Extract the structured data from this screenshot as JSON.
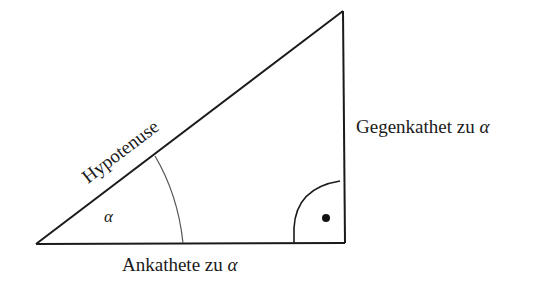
{
  "diagram": {
    "vertices": {
      "angle_vertex": {
        "x": 36,
        "y": 244
      },
      "right_angle_vertex": {
        "x": 345,
        "y": 243
      },
      "top_vertex": {
        "x": 343,
        "y": 11
      }
    },
    "labels": {
      "hypotenuse": "Hypotenuse",
      "opposite_prefix": "Gegenkathet zu ",
      "adjacent_prefix": "Ankathete zu ",
      "alpha": "α"
    },
    "right_angle_marker": "•",
    "colors": {
      "stroke": "#1a1a1a",
      "arc": "#555555",
      "background": "#ffffff"
    }
  }
}
